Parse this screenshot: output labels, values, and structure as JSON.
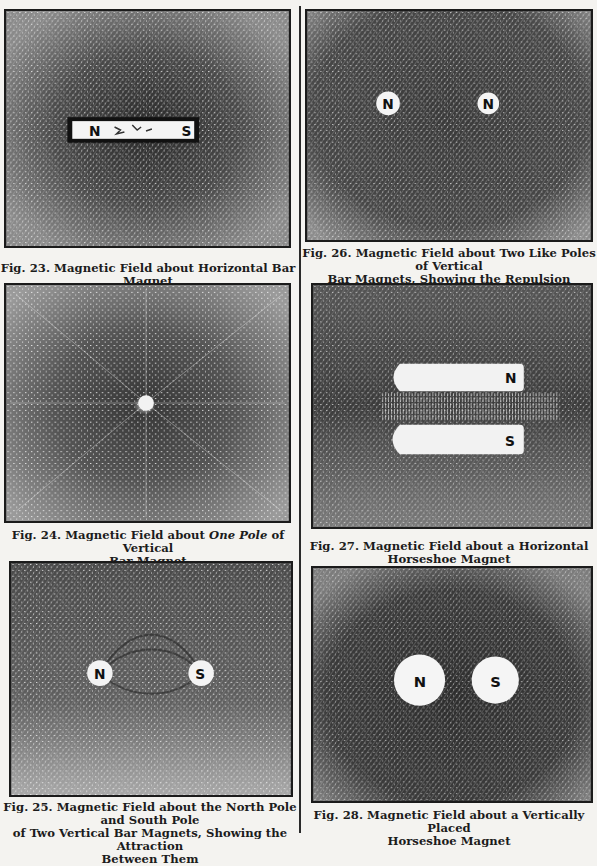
{
  "page": {
    "figures": [
      {
        "id": "fig23",
        "number": "Fig. 23.",
        "caption_lines": [
          "Fig. 23. Magnetic Field about Horizontal Bar Magnet"
        ],
        "poles": [
          "N",
          "S"
        ]
      },
      {
        "id": "fig24",
        "number": "Fig. 24.",
        "caption_pre": "Fig. 24. Magnetic Field about ",
        "caption_em": "One Pole",
        "caption_post": " of Vertical",
        "caption_line2": "Bar Magnet",
        "poles": []
      },
      {
        "id": "fig25",
        "number": "Fig. 25.",
        "caption_lines": [
          "Fig. 25. Magnetic Field about the North Pole and South Pole",
          "of Two Vertical Bar Magnets, Showing the Attraction",
          "Between Them"
        ],
        "poles": [
          "N",
          "S"
        ]
      },
      {
        "id": "fig26",
        "number": "Fig. 26.",
        "caption_lines": [
          "Fig. 26. Magnetic Field about Two Like Poles of Vertical",
          "Bar Magnets, Showing the Repulsion Between Them"
        ],
        "poles": [
          "N",
          "N"
        ]
      },
      {
        "id": "fig27",
        "number": "Fig. 27.",
        "caption_lines": [
          "Fig. 27. Magnetic Field about a Horizontal",
          "Horseshoe Magnet"
        ],
        "poles": [
          "N",
          "S"
        ]
      },
      {
        "id": "fig28",
        "number": "Fig. 28.",
        "caption_lines": [
          "Fig. 28. Magnetic Field about a Vertically Placed",
          "Horseshoe Magnet"
        ],
        "poles": [
          "N",
          "S"
        ]
      }
    ]
  }
}
